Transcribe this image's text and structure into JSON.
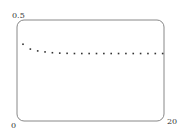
{
  "chart_data": {
    "type": "scatter",
    "title": "",
    "xlabel": "",
    "ylabel": "",
    "xlim": [
      0,
      20
    ],
    "ylim": [
      0,
      0.5
    ],
    "grid": false,
    "legend": null,
    "tick_labels": {
      "x_min": "0",
      "x_max": "20",
      "y_max": "0.5"
    },
    "series": [
      {
        "name": "sequence",
        "x": [
          1,
          2,
          3,
          4,
          5,
          6,
          7,
          8,
          9,
          10,
          11,
          12,
          13,
          14,
          15,
          16,
          17,
          18,
          19,
          20
        ],
        "values": [
          0.38,
          0.356,
          0.347,
          0.342,
          0.338,
          0.336,
          0.335,
          0.334,
          0.334,
          0.334,
          0.334,
          0.334,
          0.334,
          0.334,
          0.334,
          0.334,
          0.334,
          0.334,
          0.334,
          0.334
        ]
      }
    ]
  },
  "style": {
    "frame_color": "#888888",
    "point_color": "#333333"
  },
  "labels": {
    "y_max": "0.5",
    "origin": "0",
    "x_max": "20"
  }
}
